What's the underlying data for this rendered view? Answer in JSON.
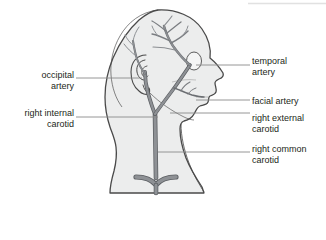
{
  "figure": {
    "background_color": "#ffffff",
    "head_fill": "#eceded",
    "head_outline_color": "#4a4a4a",
    "artery_fill": "#8e9195",
    "artery_outline_color": "#5d6064",
    "leader_line_color": "#8a8a8a",
    "label_text_color": "#231f20"
  },
  "labels": {
    "temporal_artery": "temporal\nartery",
    "facial_artery": "facial artery",
    "right_external_carotid": "right external\ncarotid",
    "right_common_carotid": "right common\ncarotid",
    "occipital_artery": "occipital\nartery",
    "right_internal_carotid": "right internal\ncarotid"
  },
  "leader_lines": {
    "temporal_artery": {
      "x1": 196,
      "y1": 65,
      "x2": 250,
      "y2": 65
    },
    "facial_artery": {
      "x1": 196,
      "y1": 100,
      "x2": 250,
      "y2": 100
    },
    "right_external_carotid": {
      "x1": 178,
      "y1": 113,
      "x2": 250,
      "y2": 113
    },
    "right_common_carotid": {
      "x1": 160,
      "y1": 152,
      "x2": 250,
      "y2": 152
    },
    "occipital_artery": {
      "x1": 76,
      "y1": 78,
      "x2": 142,
      "y2": 78
    },
    "right_internal_carotid": {
      "x1": 76,
      "y1": 117,
      "x2": 160,
      "y2": 117
    }
  },
  "structures": [
    {
      "name": "head-and-neck-silhouette",
      "kind": "outline"
    },
    {
      "name": "ear",
      "kind": "outline"
    },
    {
      "name": "eye",
      "kind": "outline"
    },
    {
      "name": "temporal-artery-vessel",
      "kind": "artery"
    },
    {
      "name": "occipital-artery-vessel",
      "kind": "artery"
    },
    {
      "name": "facial-artery-vessel",
      "kind": "artery"
    },
    {
      "name": "right-external-carotid-vessel",
      "kind": "artery"
    },
    {
      "name": "right-internal-carotid-vessel",
      "kind": "artery"
    },
    {
      "name": "right-common-carotid-vessel",
      "kind": "artery"
    },
    {
      "name": "subclavian-bifurcation",
      "kind": "artery"
    }
  ]
}
